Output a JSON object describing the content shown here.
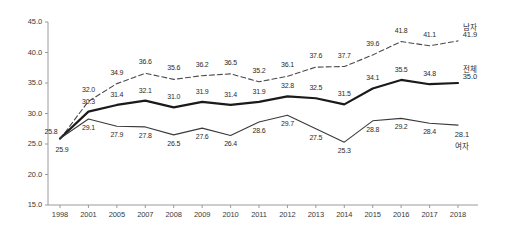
{
  "chart_data": {
    "type": "line",
    "title": "",
    "subtitle": "",
    "xlabel": "",
    "ylabel": "",
    "ylim": [
      15.0,
      45.0
    ],
    "ytick_labels": [
      "45.0",
      "40.0",
      "35.0",
      "30.0",
      "25.0",
      "20.0",
      "15.0"
    ],
    "ytick_values": [
      45.0,
      40.0,
      35.0,
      30.0,
      25.0,
      20.0,
      15.0
    ],
    "grid": false,
    "legend_position": "right-inline",
    "categories": [
      "1998",
      "2001",
      "2005",
      "2007",
      "2008",
      "2009",
      "2010",
      "2011",
      "2012",
      "2013",
      "2014",
      "2015",
      "2016",
      "2017",
      "2018"
    ],
    "series": [
      {
        "name": "남자",
        "style": "dashed",
        "color": "#4a4a4a",
        "values": [
          25.8,
          32.0,
          34.9,
          36.6,
          35.6,
          36.2,
          36.5,
          35.2,
          36.1,
          37.6,
          37.7,
          39.6,
          41.8,
          41.1,
          41.9
        ],
        "labels": [
          "25.8",
          "32.0",
          "34.9",
          "36.6",
          "35.6",
          "36.2",
          "36.5",
          "35.2",
          "36.1",
          "37.6",
          "37.7",
          "39.6",
          "41.8",
          "41.1",
          "41.9"
        ]
      },
      {
        "name": "전체",
        "style": "solid-thick",
        "color": "#1a1a1a",
        "values": [
          25.9,
          30.3,
          31.4,
          32.1,
          31.0,
          31.9,
          31.4,
          31.9,
          32.8,
          32.5,
          31.5,
          34.1,
          35.5,
          34.8,
          35.0
        ],
        "labels": [
          "25.9",
          "30.3",
          "31.4",
          "32.1",
          "31.0",
          "31.9",
          "31.4",
          "31.9",
          "32.8",
          "32.5",
          "31.5",
          "34.1",
          "35.5",
          "34.8",
          "35.0"
        ]
      },
      {
        "name": "여자",
        "style": "solid-thin",
        "color": "#3a3a3a",
        "values": [
          25.9,
          29.1,
          27.9,
          27.8,
          26.5,
          27.6,
          26.4,
          28.6,
          29.7,
          27.5,
          25.3,
          28.8,
          29.2,
          28.4,
          28.1
        ],
        "labels": [
          "25.9",
          "29.1",
          "27.9",
          "27.8",
          "26.5",
          "27.6",
          "26.4",
          "28.6",
          "29.7",
          "27.5",
          "25.3",
          "28.8",
          "29.2",
          "28.4",
          "28.1"
        ]
      }
    ],
    "endpoint_labels": [
      {
        "series": "남자",
        "text": "남자",
        "value_text": "41.9"
      },
      {
        "series": "전체",
        "text": "전체",
        "value_text": "35.0"
      },
      {
        "series": "여자",
        "text": "여자",
        "value_text": "28.1"
      }
    ],
    "start_overlap_labels": [
      "25.8",
      "25.9"
    ],
    "axis_color": "#999999"
  }
}
